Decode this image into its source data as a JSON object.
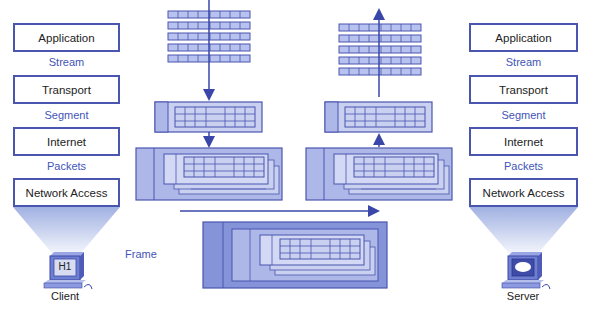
{
  "client_stack": {
    "layers": [
      "Application",
      "Transport",
      "Internet",
      "Network Access"
    ],
    "pdus": [
      "Stream",
      "Segment",
      "Packets"
    ],
    "device": {
      "label": "Client",
      "screen_text": "H1"
    }
  },
  "server_stack": {
    "layers": [
      "Application",
      "Transport",
      "Internet",
      "Network Access"
    ],
    "pdus": [
      "Stream",
      "Segment",
      "Packets"
    ],
    "device": {
      "label": "Server"
    }
  },
  "center": {
    "frame_label": "Frame"
  },
  "colors": {
    "accent": "#4a55b0",
    "pdu_text": "#3f55b8",
    "fill_light": "#c9d0f0",
    "fill_mid": "#a9b3e6",
    "fill_dark": "#7c89d6"
  }
}
